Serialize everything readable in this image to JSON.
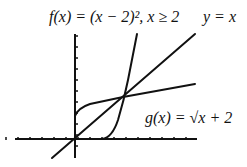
{
  "labels": {
    "f": "f(x) = (x − 2)², x ≥ 2",
    "line": "y = x",
    "g": "g(x) = √x + 2"
  },
  "colors": {
    "stroke": "#111111",
    "background": "#ffffff"
  },
  "axes": {
    "origin_px": [
      75,
      139
    ],
    "x_range_px": [
      15,
      197
    ],
    "y_range_px": [
      34,
      158
    ],
    "tick_spacing_px": 12
  }
}
